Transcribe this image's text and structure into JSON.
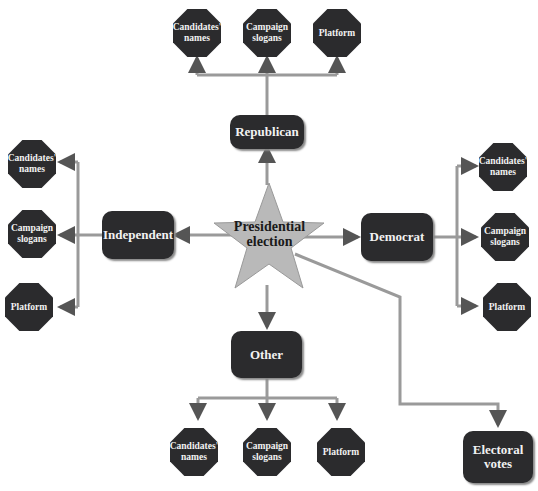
{
  "center": {
    "label_line1": "Presidential",
    "label_line2": "election",
    "color": "#b9b9b9"
  },
  "parties": {
    "republican": {
      "label": "Republican",
      "children": [
        {
          "line1": "Candidates'",
          "line2": "names"
        },
        {
          "line1": "Campaign",
          "line2": "slogans"
        },
        {
          "line1": "Platform",
          "line2": ""
        }
      ]
    },
    "independent": {
      "label": "Independent",
      "children": [
        {
          "line1": "Candidates'",
          "line2": "names"
        },
        {
          "line1": "Campaign",
          "line2": "slogans"
        },
        {
          "line1": "Platform",
          "line2": ""
        }
      ]
    },
    "democrat": {
      "label": "Democrat",
      "children": [
        {
          "line1": "Candidates'",
          "line2": "names"
        },
        {
          "line1": "Campaign",
          "line2": "slogans"
        },
        {
          "line1": "Platform",
          "line2": ""
        }
      ]
    },
    "other": {
      "label": "Other",
      "children": [
        {
          "line1": "Candidates'",
          "line2": "names"
        },
        {
          "line1": "Campaign",
          "line2": "slogans"
        },
        {
          "line1": "Platform",
          "line2": ""
        }
      ]
    }
  },
  "electoral": {
    "line1": "Electoral",
    "line2": "votes"
  },
  "colors": {
    "node": "#2b2b2d",
    "connector": "#8f8f8f",
    "connector_dark": "#1a1a1a"
  }
}
